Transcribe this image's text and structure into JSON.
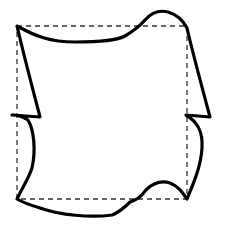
{
  "diagram": {
    "colors": {
      "background": "#ffffff",
      "outline": "#000000",
      "guide": "#333333"
    },
    "elements": [
      {
        "name": "reference-square",
        "style": "dashed"
      },
      {
        "name": "deformed-tile",
        "style": "solid-thick"
      }
    ]
  }
}
